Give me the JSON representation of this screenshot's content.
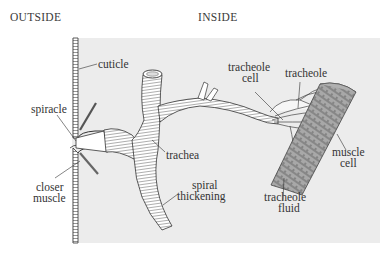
{
  "headers": {
    "outside": "OUTSIDE",
    "inside": "INSIDE"
  },
  "labels": {
    "cuticle": "cuticle",
    "spiracle": "spiracle",
    "closer_muscle_1": "closer",
    "closer_muscle_2": "muscle",
    "trachea": "trachea",
    "spiral_thickening_1": "spiral",
    "spiral_thickening_2": "thickening",
    "tracheole_cell_1": "tracheole",
    "tracheole_cell_2": "cell",
    "tracheole": "tracheole",
    "muscle_cell_1": "muscle",
    "muscle_cell_2": "cell",
    "tracheole_fluid_1": "tracheole",
    "tracheole_fluid_2": "fluid"
  },
  "colors": {
    "panel": "#ececec",
    "ink": "#333333",
    "tube": "#ffffff",
    "muscle": "#9a9a9a"
  }
}
